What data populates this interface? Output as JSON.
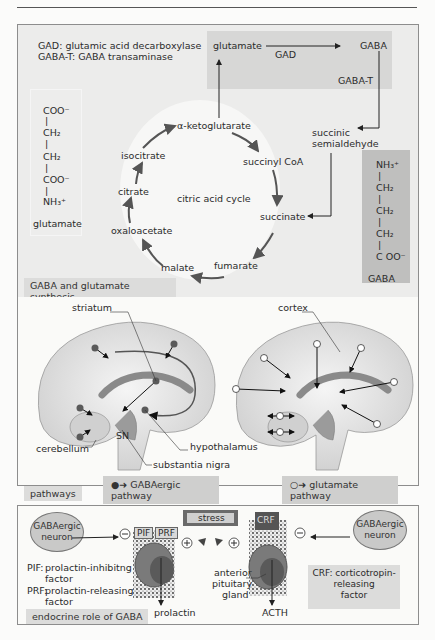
{
  "header": {
    "section_title": "Cellular Structures",
    "page_number": "...",
    "note": "partially cut off"
  },
  "panel_synthesis": {
    "legend": {
      "gad": "GAD:    glutamic acid decarboxylase",
      "gabat": "GABA-T: GABA transaminase"
    },
    "top_box": {
      "glutamate": "glutamate",
      "gaba": "GABA",
      "gad": "GAD",
      "gabat": "GABA-T"
    },
    "succinic_semialdehyde": [
      "succinic",
      "semialdehyde"
    ],
    "cycle": {
      "title": "citric acid cycle",
      "nodes": [
        "α-ketoglutarate",
        "succinyl CoA",
        "succinate",
        "fumarate",
        "malate",
        "oxaloacetate",
        "citrate",
        "isocitrate"
      ]
    },
    "glutamate_molecule": {
      "lines": [
        "COO⁻",
        "|",
        "CH₂",
        "|",
        "CH₂",
        "|",
        "COO⁻",
        "|",
        "NH₃⁺"
      ],
      "name": "glutamate"
    },
    "gaba_molecule": {
      "lines": [
        "NH₃⁺",
        "|",
        "CH₂",
        "|",
        "CH₂",
        "|",
        "CH₂",
        "|",
        "C OO⁻"
      ],
      "name": "GABA"
    },
    "caption": "GABA and glutamate synthesis"
  },
  "panel_pathways": {
    "left_labels": {
      "striatum": "striatum",
      "sn": "SN",
      "cerebellum": "cerebellum",
      "hypothalamus": "hypothalamus",
      "substantia_nigra": "substantia nigra"
    },
    "right_labels": {
      "cortex": "cortex"
    },
    "legend_gaba": "GABAergic pathway",
    "legend_glu": "glutamate  pathway",
    "caption": "pathways"
  },
  "panel_endocrine": {
    "left_neuron": "GABAergic neuron",
    "right_neuron": "GABAergic neuron",
    "pif": "PIF",
    "prf": "PRF",
    "crf": "CRF",
    "stress": "stress",
    "prolactin": "prolactin",
    "acth": "ACTH",
    "pituitary": [
      "anterior",
      "pituitary",
      "gland"
    ],
    "defs": {
      "pif_key": "PIF:",
      "pif_val1": "prolactin-inhibitng",
      "pif_val2": "factor",
      "prf_key": "PRF:",
      "prf_val1": "prolactin-releasing",
      "prf_val2": "factor",
      "crf": [
        "CRF: corticotropin-",
        "releasing",
        "factor"
      ]
    },
    "minus": "⊖",
    "plus": "⊕",
    "caption": "endocrine role of GABA"
  }
}
